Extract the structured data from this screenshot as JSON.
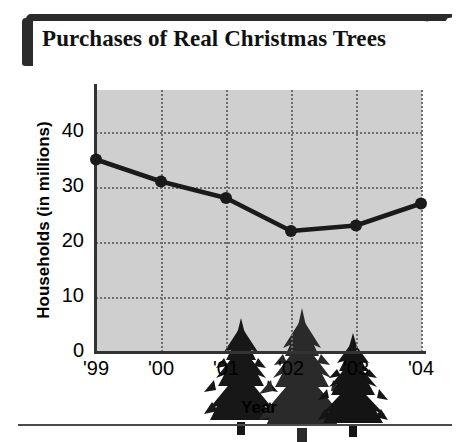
{
  "title": "Purchases of Real Christmas Trees",
  "decor": {
    "bracket_color": "#2b2b2b",
    "tree_icon": "christmas-tree-icon",
    "tree_count": 3
  },
  "chart_data": {
    "type": "line",
    "title": "Purchases of Real Christmas Trees",
    "xlabel": "Year",
    "ylabel": "Households (in millions)",
    "categories": [
      "'99",
      "'00",
      "'01",
      "'02",
      "'03",
      "'04"
    ],
    "values": [
      35,
      31,
      28,
      22,
      23,
      27
    ],
    "series": [
      {
        "name": "Households (in millions)",
        "values": [
          35,
          31,
          28,
          22,
          23,
          27
        ]
      }
    ],
    "ylim": [
      0,
      45
    ],
    "yticks": [
      0,
      10,
      20,
      30,
      40
    ],
    "ytick_labels": [
      "0",
      "10",
      "20",
      "30",
      "40"
    ],
    "xtick_labels": [
      "'99",
      "'00",
      "'01",
      "'02",
      "'03",
      "'04"
    ],
    "grid": true,
    "grid_style": "dotted",
    "legend": "none",
    "plot_background": "#cfcfcf",
    "line_color": "#1a1a1a",
    "marker": "circle"
  }
}
